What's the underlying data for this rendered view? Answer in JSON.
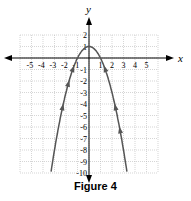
{
  "chart_data": {
    "type": "line",
    "title": "",
    "caption": "Figure 4",
    "xlabel": "x",
    "ylabel": "y",
    "xlim": [
      -6,
      6
    ],
    "ylim": [
      -10,
      2
    ],
    "grid": true,
    "x_ticks": [
      -5,
      -4,
      -3,
      -2,
      -1,
      1,
      2,
      3,
      4,
      5
    ],
    "y_ticks": [
      2,
      1,
      -1,
      -2,
      -3,
      -4,
      -5,
      -6,
      -7,
      -8,
      -9,
      -10
    ],
    "series": [
      {
        "name": "y = -x^2 + 1",
        "function": "-x^2+1",
        "x": [
          -3.3,
          -3,
          -2,
          -1,
          0,
          1,
          2,
          3,
          3.3
        ],
        "y": [
          -9.89,
          -8,
          -3,
          0,
          1,
          0,
          -3,
          -8,
          -9.89
        ]
      }
    ]
  },
  "caption": "Figure 4",
  "axis": {
    "x": "x",
    "y": "y"
  }
}
